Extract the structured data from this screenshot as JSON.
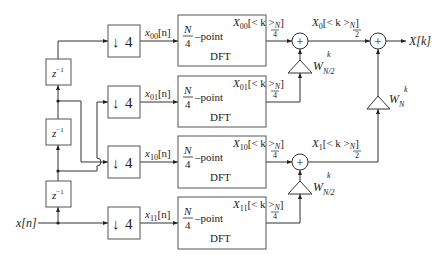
{
  "diagram": {
    "input_label": "x[n]",
    "output_label": "X[k]",
    "delays": [
      {
        "label": "z",
        "exp": "−1"
      },
      {
        "label": "z",
        "exp": "−1"
      },
      {
        "label": "z",
        "exp": "−1"
      }
    ],
    "downsamplers": [
      {
        "factor": "4",
        "arrow": "↓"
      },
      {
        "factor": "4",
        "arrow": "↓"
      },
      {
        "factor": "4",
        "arrow": "↓"
      },
      {
        "factor": "4",
        "arrow": "↓"
      }
    ],
    "subsequences": [
      {
        "base": "x",
        "sub": "00",
        "arg": "[n]"
      },
      {
        "base": "x",
        "sub": "01",
        "arg": "[n]"
      },
      {
        "base": "x",
        "sub": "10",
        "arg": "[n]"
      },
      {
        "base": "x",
        "sub": "11",
        "arg": "[n]"
      }
    ],
    "dft_blocks": [
      {
        "num": "N",
        "den": "4",
        "suffix": "–point",
        "name": "DFT"
      },
      {
        "num": "N",
        "den": "4",
        "suffix": "–point",
        "name": "DFT"
      },
      {
        "num": "N",
        "den": "4",
        "suffix": "–point",
        "name": "DFT"
      },
      {
        "num": "N",
        "den": "4",
        "suffix": "–point",
        "name": "DFT"
      }
    ],
    "dft_outputs": [
      {
        "base": "X",
        "sub": "00",
        "arg": "[< k >",
        "mod_num": "N",
        "mod_den": "4",
        "close": "]"
      },
      {
        "base": "X",
        "sub": "01",
        "arg": "[< k >",
        "mod_num": "N",
        "mod_den": "4",
        "close": "]"
      },
      {
        "base": "X",
        "sub": "10",
        "arg": "[< k >",
        "mod_num": "N",
        "mod_den": "4",
        "close": "]"
      },
      {
        "base": "X",
        "sub": "11",
        "arg": "[< k >",
        "mod_num": "N",
        "mod_den": "4",
        "close": "]"
      }
    ],
    "stage2_outputs": [
      {
        "base": "X",
        "sub": "0",
        "arg": "[< k >",
        "mod_num": "N",
        "mod_den": "2",
        "close": "]"
      },
      {
        "base": "X",
        "sub": "1",
        "arg": "[< k >",
        "mod_num": "N",
        "mod_den": "2",
        "close": "]"
      }
    ],
    "twiddles": [
      {
        "base": "W",
        "sub": "N/2",
        "sup": "k"
      },
      {
        "base": "W",
        "sub": "N/2",
        "sup": "k"
      },
      {
        "base": "W",
        "sub": "N",
        "sup": "k"
      }
    ],
    "adder_symbol": "+"
  }
}
